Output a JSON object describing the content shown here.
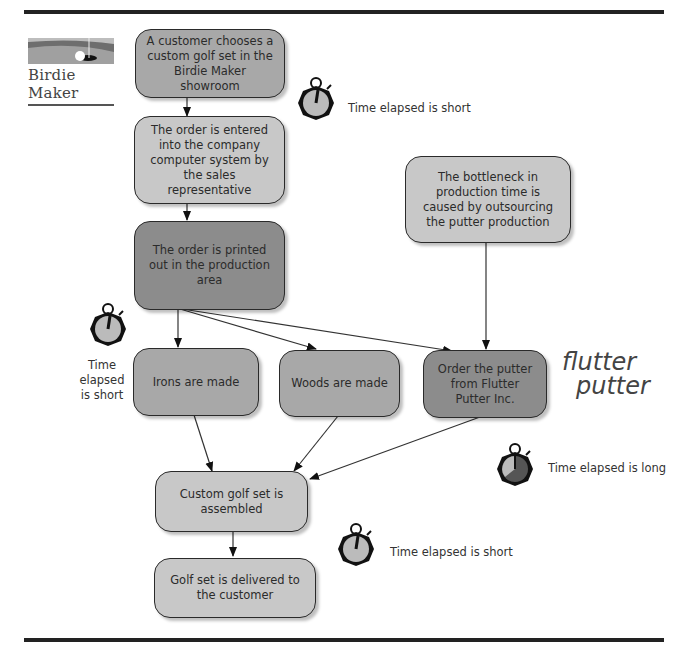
{
  "logo": {
    "text": "Birdie Maker"
  },
  "brand_mark": {
    "line1": "flutter",
    "line2": "putter"
  },
  "nodes": {
    "choose": "A customer chooses a custom golf set in the Birdie Maker showroom",
    "entered": "The order is entered into the company computer system by the sales representative",
    "printed": "The order is printed out in the production area",
    "bottleneck": "The bottleneck in production time is caused by outsourcing the putter production",
    "irons": "Irons are made",
    "woods": "Woods are made",
    "putter": "Order the putter from Flutter Putter Inc.",
    "assembled": "Custom golf set is assembled",
    "delivered": "Golf set is delivered to the customer"
  },
  "annotations": {
    "t1": "Time elapsed is short",
    "t2_line1": "Time",
    "t2_line2": "elapsed",
    "t2_line3": "is short",
    "t3": "Time elapsed is long",
    "t4": "Time elapsed is short"
  },
  "colors": {
    "dark": "#8c8c8c",
    "mid": "#a8a8a8",
    "light": "#c8c8c8",
    "rule": "#222222"
  }
}
